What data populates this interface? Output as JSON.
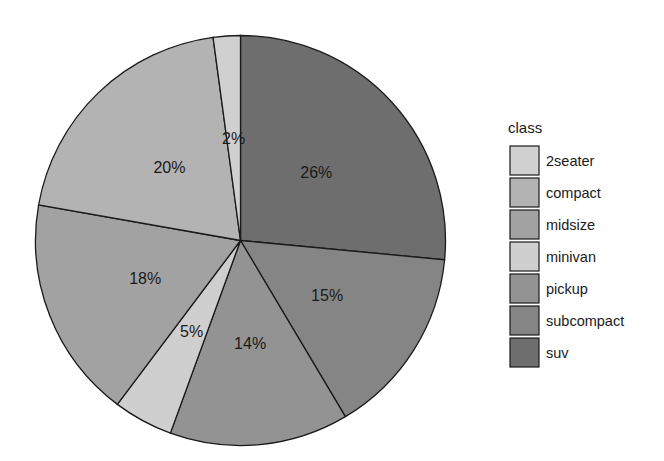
{
  "chart_data": {
    "type": "pie",
    "title": "",
    "legend_title": "class",
    "legend_position": "right",
    "categories": [
      "2seater",
      "compact",
      "midsize",
      "minivan",
      "pickup",
      "subcompact",
      "suv"
    ],
    "values": [
      5,
      47,
      41,
      11,
      33,
      35,
      62
    ],
    "percent_labels": [
      "2%",
      "20%",
      "18%",
      "5%",
      "14%",
      "15%",
      "26%"
    ],
    "colors": [
      "#d0d0d0",
      "#b3b3b3",
      "#a2a2a2",
      "#cfcfcf",
      "#939393",
      "#858585",
      "#6e6e6e"
    ],
    "clockwise_order_from_top": [
      "suv",
      "subcompact",
      "pickup",
      "minivan",
      "midsize",
      "compact",
      "2seater"
    ]
  },
  "legend": {
    "title": "class",
    "items": [
      {
        "label": "2seater"
      },
      {
        "label": "compact"
      },
      {
        "label": "midsize"
      },
      {
        "label": "minivan"
      },
      {
        "label": "pickup"
      },
      {
        "label": "subcompact"
      },
      {
        "label": "suv"
      }
    ]
  }
}
